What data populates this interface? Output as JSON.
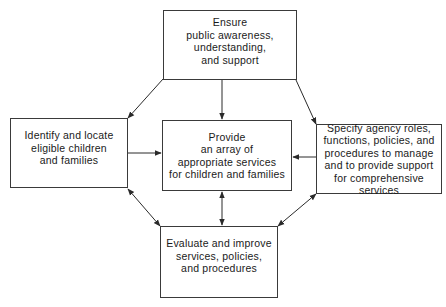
{
  "diagram": {
    "type": "flow",
    "nodes": [
      {
        "id": "top",
        "label": "Ensure\npublic awareness,\nunderstanding,\nand support"
      },
      {
        "id": "left",
        "label": "Identify and locate\neligible children\nand families"
      },
      {
        "id": "center",
        "label": "Provide\nan array of\nappropriate services\nfor children and families"
      },
      {
        "id": "right",
        "label": "Specify agency roles,\nfunctions, policies, and\nprocedures to manage\nand to provide support\nfor comprehensive\nservices"
      },
      {
        "id": "bottom",
        "label": "Evaluate and improve\nservices, policies,\nand procedures"
      }
    ],
    "edges": [
      {
        "from": "top",
        "to": "left",
        "direction": "one-way"
      },
      {
        "from": "top",
        "to": "center",
        "direction": "one-way"
      },
      {
        "from": "top",
        "to": "right",
        "direction": "one-way"
      },
      {
        "from": "left",
        "to": "center",
        "direction": "one-way"
      },
      {
        "from": "right",
        "to": "center",
        "direction": "one-way"
      },
      {
        "from": "center",
        "to": "bottom",
        "direction": "two-way"
      },
      {
        "from": "left",
        "to": "bottom",
        "direction": "two-way"
      },
      {
        "from": "right",
        "to": "bottom",
        "direction": "two-way"
      }
    ],
    "colors": {
      "line": "#2a2a2a",
      "border": "#3a3a3a",
      "text": "#1a1a1a",
      "background": "#ffffff"
    }
  }
}
